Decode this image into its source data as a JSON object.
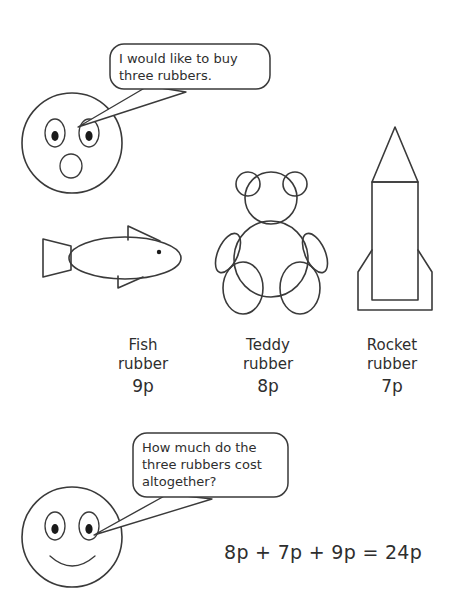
{
  "page": {
    "background_color": "#ffffff",
    "ink_color": "#3a3a3a"
  },
  "characters": [
    {
      "name": "surprised-face",
      "expression": "surprised",
      "position": "top-left"
    },
    {
      "name": "smiling-face",
      "expression": "smiling",
      "position": "bottom-left"
    }
  ],
  "speech_bubbles": [
    {
      "id": "bubble-1",
      "speaker": "surprised-face",
      "text": "I would like to buy\nthree rubbers."
    },
    {
      "id": "bubble-2",
      "speaker": "smiling-face",
      "text": "How much do the\nthree rubbers cost\naltogether?"
    }
  ],
  "items": [
    {
      "id": "fish",
      "icon": "fish-icon",
      "name": "Fish\nrubber",
      "price": "9p"
    },
    {
      "id": "teddy",
      "icon": "teddy-bear-icon",
      "name": "Teddy\nrubber",
      "price": "8p"
    },
    {
      "id": "rocket",
      "icon": "rocket-icon",
      "name": "Rocket\nrubber",
      "price": "7p"
    }
  ],
  "answer": {
    "equation": "8p + 7p + 9p = 24p",
    "total": "24p"
  }
}
